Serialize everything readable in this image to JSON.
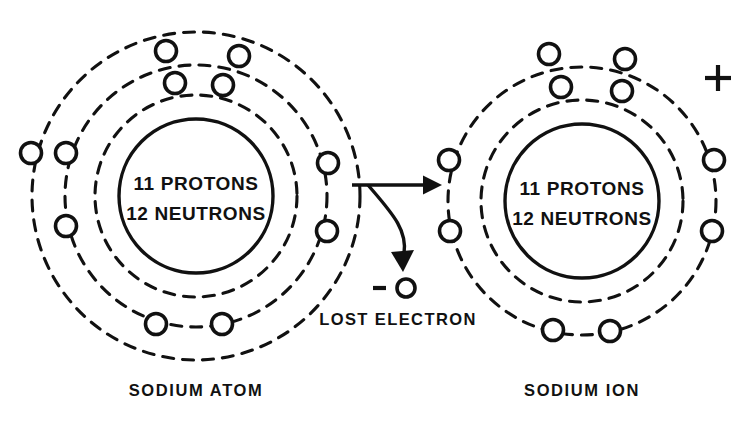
{
  "figure": {
    "title_left": "SODIUM ATOM",
    "title_right": "SODIUM ION",
    "annotation_lost_electron": "LOST ELECTRON",
    "charge_sign_positive": "+",
    "charge_sign_negative": "−",
    "ink_color": "#111111",
    "background_color": "#ffffff"
  },
  "sodium_atom": {
    "nucleus": {
      "line1": "11 PROTONS",
      "line2": "12 NEUTRONS",
      "protons": 11,
      "neutrons": 12,
      "center_x": 196,
      "center_y": 196,
      "radius": 77
    },
    "shells": [
      {
        "name": "inner-shell",
        "radius": 101,
        "electron_count": 2
      },
      {
        "name": "middle-shell",
        "radius": 131,
        "electron_count": 8
      },
      {
        "name": "outer-shell",
        "radius": 164,
        "electron_count": 1
      }
    ],
    "electron_count_total": 11,
    "electrons": [
      {
        "shell": "inner-shell",
        "x": 175,
        "y": 83
      },
      {
        "shell": "inner-shell",
        "x": 223,
        "y": 85
      },
      {
        "shell": "middle-shell",
        "x": 66,
        "y": 153
      },
      {
        "shell": "middle-shell",
        "x": 66,
        "y": 226
      },
      {
        "shell": "middle-shell",
        "x": 156,
        "y": 324
      },
      {
        "shell": "middle-shell",
        "x": 222,
        "y": 324
      },
      {
        "shell": "middle-shell",
        "x": 328,
        "y": 163
      },
      {
        "shell": "middle-shell",
        "x": 327,
        "y": 231
      },
      {
        "shell": "middle-shell",
        "x": 166,
        "y": 51
      },
      {
        "shell": "middle-shell",
        "x": 239,
        "y": 56
      },
      {
        "shell": "outer-shell",
        "x": 31,
        "y": 153
      }
    ],
    "caption_x": 196,
    "caption_y": 396
  },
  "sodium_ion": {
    "nucleus": {
      "line1": "11 PROTONS",
      "line2": "12 NEUTRONS",
      "protons": 11,
      "neutrons": 12,
      "center_x": 582,
      "center_y": 201,
      "radius": 77
    },
    "shells": [
      {
        "name": "inner-shell",
        "radius": 101,
        "electron_count": 2
      },
      {
        "name": "outer-shell",
        "radius": 134,
        "electron_count": 8
      }
    ],
    "electron_count_total": 10,
    "electrons": [
      {
        "shell": "inner-shell",
        "x": 561,
        "y": 87
      },
      {
        "shell": "inner-shell",
        "x": 622,
        "y": 91
      },
      {
        "shell": "outer-shell",
        "x": 549,
        "y": 54
      },
      {
        "shell": "outer-shell",
        "x": 625,
        "y": 59
      },
      {
        "shell": "outer-shell",
        "x": 449,
        "y": 160
      },
      {
        "shell": "outer-shell",
        "x": 450,
        "y": 231
      },
      {
        "shell": "outer-shell",
        "x": 714,
        "y": 160
      },
      {
        "shell": "outer-shell",
        "x": 712,
        "y": 231
      },
      {
        "shell": "outer-shell",
        "x": 553,
        "y": 330
      },
      {
        "shell": "outer-shell",
        "x": 610,
        "y": 331
      }
    ],
    "charge_x": 718,
    "charge_y": 78,
    "caption_x": 582,
    "caption_y": 396
  },
  "lost_electron": {
    "x": 406,
    "y": 288,
    "radius": 9,
    "sign_x": 382,
    "sign_y": 288,
    "label_x": 398,
    "label_y": 325
  },
  "transfer_arrow": {
    "start_x": 352,
    "start_y": 185,
    "end_x": 442,
    "end_y": 185
  },
  "curved_arrow": {
    "start_x": 368,
    "start_y": 185,
    "end_x": 404,
    "end_y": 268
  }
}
